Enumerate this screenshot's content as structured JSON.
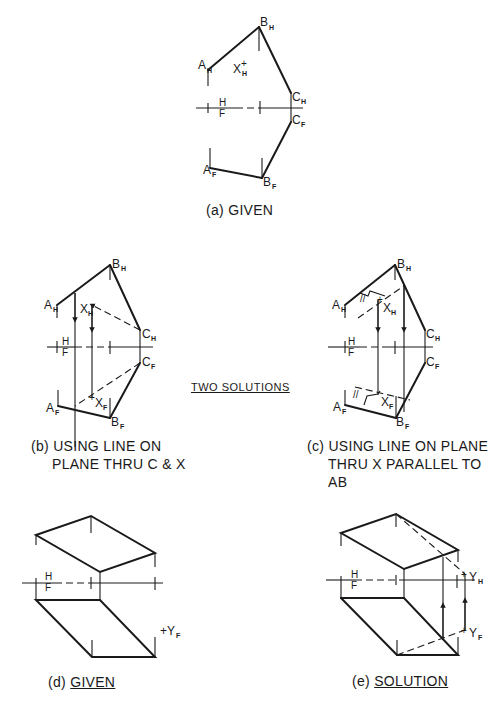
{
  "figures": {
    "a": {
      "caption_prefix": "(a)",
      "caption_text": "GIVEN",
      "labels": {
        "A": "A",
        "A_sub": "H",
        "B": "B",
        "B_sub": "H",
        "X": "X",
        "X_sub": "H",
        "CH": "C",
        "CH_sub": "H",
        "CF": "C",
        "CF_sub": "F",
        "AF": "A",
        "AF_sub": "F",
        "BF": "B",
        "BF_sub": "F"
      },
      "fold": {
        "top": "H",
        "bottom": "F"
      }
    },
    "b": {
      "caption_line1": "(b) USING LINE ON",
      "caption_line2": "PLANE THRU C & X",
      "labels": {
        "AH": "A",
        "AH_sub": "H",
        "BH": "B",
        "BH_sub": "H",
        "XH": "X",
        "XH_sub": "H",
        "CH": "C",
        "CH_sub": "H",
        "CF": "C",
        "CF_sub": "F",
        "AF": "A",
        "AF_sub": "F",
        "BF": "B",
        "BF_sub": "F",
        "XF": "X",
        "XF_sub": "F"
      },
      "fold": {
        "top": "H",
        "bottom": "F"
      }
    },
    "c": {
      "caption_line1": "(c) USING LINE ON PLANE",
      "caption_line2": "THRU X PARALLEL TO",
      "caption_line3": "AB",
      "labels": {
        "AH": "A",
        "AH_sub": "H",
        "BH": "B",
        "BH_sub": "H",
        "XH": "X",
        "XH_sub": "H",
        "CH": "C",
        "CH_sub": "H",
        "CF": "C",
        "CF_sub": "F",
        "AF": "A",
        "AF_sub": "F",
        "BF": "B",
        "BF_sub": "F",
        "XF": "X",
        "XF_sub": "F",
        "parallel_mark": "//"
      },
      "fold": {
        "top": "H",
        "bottom": "F"
      }
    },
    "d": {
      "caption_prefix": "(d)",
      "caption_text": "GIVEN",
      "labels": {
        "YF": "+Y",
        "YF_sub": "F"
      },
      "fold": {
        "top": "H",
        "bottom": "F"
      }
    },
    "e": {
      "caption_prefix": "(e)",
      "caption_text": "SOLUTION",
      "labels": {
        "YH": "Y",
        "YH_sub": "H",
        "YF": "Y",
        "YF_sub": "F"
      },
      "fold": {
        "top": "H",
        "bottom": "F"
      }
    }
  },
  "center_note": "TWO  SOLUTIONS"
}
